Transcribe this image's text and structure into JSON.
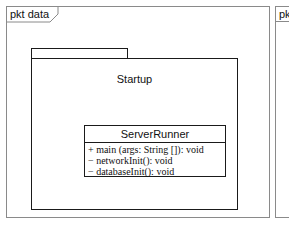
{
  "frames": [
    {
      "label": "pkt data"
    },
    {
      "label": "pk"
    }
  ],
  "package": {
    "name": "Startup"
  },
  "class": {
    "name": "ServerRunner",
    "operations": [
      "+ main (args: String []): void",
      "− networkInit(): void",
      "− databaseInit(): void"
    ]
  }
}
